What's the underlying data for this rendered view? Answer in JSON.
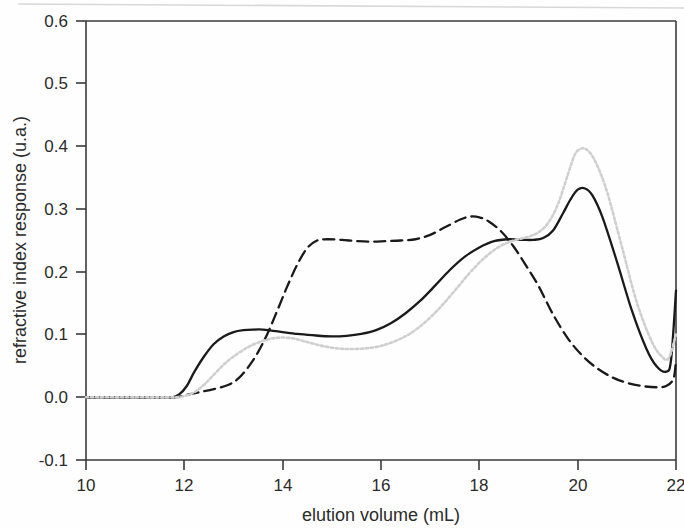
{
  "chart_data": {
    "type": "line",
    "title": "",
    "xlabel": "elution volume (mL)",
    "ylabel": "refractive index response (u.a.)",
    "xlim": [
      10,
      22
    ],
    "ylim": [
      -0.1,
      0.6
    ],
    "xticks": [
      "10",
      "12",
      "14",
      "16",
      "18",
      "20",
      "22"
    ],
    "yticks": [
      "0.6",
      "0.5",
      "0.4",
      "0.3",
      "0.2",
      "0.1",
      "0.0",
      "-0.1"
    ],
    "grid": false,
    "legend": "none",
    "frame": "box",
    "series": [
      {
        "name": "solid curve",
        "style": "solid",
        "color": "#1a1a1a",
        "x": [
          10.0,
          10.5,
          11.0,
          11.5,
          11.75,
          11.9,
          12.05,
          12.2,
          12.4,
          12.6,
          12.8,
          13.0,
          13.2,
          13.4,
          13.6,
          13.8,
          14.0,
          14.3,
          14.6,
          15.0,
          15.3,
          15.6,
          15.9,
          16.2,
          16.5,
          16.8,
          17.1,
          17.4,
          17.7,
          18.0,
          18.3,
          18.6,
          18.9,
          19.1,
          19.3,
          19.5,
          19.7,
          19.85,
          20.0,
          20.15,
          20.3,
          20.5,
          20.8,
          21.1,
          21.4,
          21.6,
          21.8,
          21.9,
          22.0
        ],
        "y": [
          0.0,
          0.0,
          0.0,
          0.0,
          0.0,
          0.005,
          0.018,
          0.04,
          0.065,
          0.085,
          0.097,
          0.104,
          0.107,
          0.108,
          0.108,
          0.106,
          0.104,
          0.101,
          0.099,
          0.097,
          0.098,
          0.101,
          0.107,
          0.118,
          0.134,
          0.154,
          0.178,
          0.203,
          0.224,
          0.239,
          0.249,
          0.252,
          0.251,
          0.251,
          0.254,
          0.266,
          0.293,
          0.315,
          0.331,
          0.333,
          0.322,
          0.288,
          0.216,
          0.139,
          0.077,
          0.05,
          0.041,
          0.06,
          0.17
        ]
      },
      {
        "name": "dashed curve",
        "style": "dashed",
        "color": "#1a1a1a",
        "x": [
          10.0,
          11.0,
          11.8,
          12.0,
          12.3,
          12.6,
          12.9,
          13.1,
          13.3,
          13.5,
          13.7,
          13.9,
          14.1,
          14.3,
          14.5,
          14.7,
          14.9,
          15.2,
          15.5,
          15.8,
          16.1,
          16.4,
          16.7,
          17.0,
          17.3,
          17.6,
          17.8,
          18.0,
          18.2,
          18.45,
          18.7,
          18.95,
          19.2,
          19.5,
          19.8,
          20.1,
          20.4,
          20.7,
          21.0,
          21.3,
          21.6,
          21.8,
          21.95,
          22.0
        ],
        "y": [
          0.0,
          0.0,
          0.0,
          0.003,
          0.008,
          0.013,
          0.02,
          0.03,
          0.048,
          0.072,
          0.103,
          0.14,
          0.178,
          0.212,
          0.238,
          0.25,
          0.252,
          0.251,
          0.249,
          0.248,
          0.249,
          0.25,
          0.252,
          0.259,
          0.271,
          0.283,
          0.288,
          0.287,
          0.28,
          0.264,
          0.24,
          0.21,
          0.178,
          0.132,
          0.094,
          0.066,
          0.046,
          0.032,
          0.023,
          0.018,
          0.016,
          0.018,
          0.03,
          0.06
        ]
      },
      {
        "name": "dotted curve",
        "style": "dotted",
        "color": "#cfcfcf",
        "x": [
          10.0,
          11.0,
          11.8,
          12.0,
          12.2,
          12.4,
          12.6,
          12.8,
          13.0,
          13.3,
          13.6,
          13.9,
          14.2,
          14.5,
          14.8,
          15.1,
          15.4,
          15.7,
          16.0,
          16.3,
          16.6,
          16.9,
          17.2,
          17.5,
          17.8,
          18.1,
          18.4,
          18.7,
          19.0,
          19.2,
          19.4,
          19.6,
          19.8,
          19.95,
          20.1,
          20.25,
          20.4,
          20.6,
          20.9,
          21.2,
          21.5,
          21.7,
          21.85,
          22.0
        ],
        "y": [
          0.0,
          0.0,
          0.0,
          0.002,
          0.008,
          0.02,
          0.036,
          0.052,
          0.065,
          0.08,
          0.09,
          0.095,
          0.094,
          0.088,
          0.082,
          0.078,
          0.077,
          0.078,
          0.082,
          0.09,
          0.102,
          0.12,
          0.143,
          0.17,
          0.198,
          0.222,
          0.24,
          0.25,
          0.256,
          0.263,
          0.278,
          0.308,
          0.355,
          0.388,
          0.397,
          0.39,
          0.369,
          0.327,
          0.24,
          0.152,
          0.09,
          0.066,
          0.062,
          0.1
        ]
      }
    ]
  },
  "axes": {
    "x_title": "elution volume (mL)",
    "y_title": "refractive index response (u.a.)",
    "x_tick_labels": [
      "10",
      "12",
      "14",
      "16",
      "18",
      "20",
      "22"
    ],
    "y_tick_labels": [
      "0.6",
      "0.5",
      "0.4",
      "0.3",
      "0.2",
      "0.1",
      "0.0",
      "-0.1"
    ]
  },
  "colors": {
    "axis": "#3a3a3a",
    "solid_curve": "#1a1a1a",
    "dashed_curve": "#1a1a1a",
    "dotted_curve": "#cfcfcf",
    "background": "#ffffff"
  }
}
